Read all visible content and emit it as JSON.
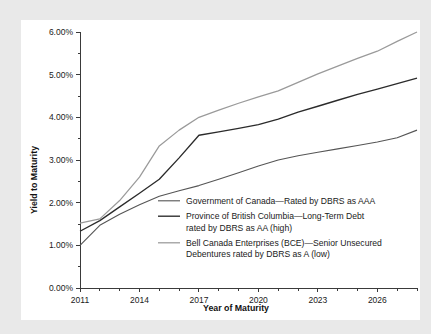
{
  "page": {
    "background_color": "#e9e9e9",
    "panel_color": "#ffffff"
  },
  "chart_data": {
    "type": "line",
    "title": "",
    "xlabel": "Year of Maturity",
    "ylabel": "Yield to Maturity",
    "xlim": [
      2011,
      2028
    ],
    "ylim": [
      0,
      6
    ],
    "grid": false,
    "legend_position": "inside-lower-right",
    "x_tick_labels": [
      "2011",
      "2014",
      "2017",
      "2020",
      "2023",
      "2026"
    ],
    "x_tick_values": [
      2011,
      2014,
      2017,
      2020,
      2023,
      2026
    ],
    "x_minor_tick_values": [
      2012,
      2013,
      2015,
      2016,
      2018,
      2019,
      2021,
      2022,
      2024,
      2025,
      2027,
      2028
    ],
    "y_tick_labels": [
      "0.00%",
      "1.00%",
      "2.00%",
      "3.00%",
      "4.00%",
      "5.00%",
      "6.00%"
    ],
    "y_tick_values": [
      0,
      1,
      2,
      3,
      4,
      5,
      6
    ],
    "y_minor_tick_values": [
      0.5,
      1.5,
      2.5,
      3.5,
      4.5,
      5.5
    ],
    "series": [
      {
        "name": "Government of Canada—Rated by DBRS as AAA",
        "legend_label": "Government of Canada—Rated by DBRS as AAA",
        "color": "#555555",
        "width": 1.1,
        "x": [
          2011,
          2012,
          2013,
          2014,
          2015,
          2016,
          2017,
          2018,
          2019,
          2020,
          2021,
          2022,
          2023,
          2024,
          2025,
          2026,
          2027,
          2028
        ],
        "values": [
          1.0,
          1.47,
          1.73,
          1.95,
          2.15,
          2.28,
          2.4,
          2.55,
          2.7,
          2.86,
          3.0,
          3.1,
          3.18,
          3.26,
          3.34,
          3.42,
          3.52,
          3.7
        ]
      },
      {
        "name": "Province of British Columbia—Long-Term Debt rated by DBRS as AA (high)",
        "legend_label_line1": "Province of British Columbia—Long-Term Debt",
        "legend_label_line2": "rated by DBRS as AA (high)",
        "color": "#2b2b2b",
        "width": 1.35,
        "x": [
          2011,
          2012,
          2013,
          2014,
          2015,
          2016,
          2017,
          2018,
          2019,
          2020,
          2021,
          2022,
          2023,
          2024,
          2025,
          2026,
          2027,
          2028
        ],
        "values": [
          1.33,
          1.58,
          1.9,
          2.22,
          2.55,
          3.05,
          3.58,
          3.66,
          3.74,
          3.83,
          3.96,
          4.12,
          4.26,
          4.4,
          4.54,
          4.66,
          4.79,
          4.92
        ]
      },
      {
        "name": "Bell Canada Enterprises (BCE)—Senior Unsecured Debentures rated by DBRS as A (low)",
        "legend_label_line1": "Bell Canada Enterprises (BCE)—Senior Unsecured",
        "legend_label_line2": "Debentures rated by DBRS as A (low)",
        "color": "#9a9a9a",
        "width": 1.25,
        "x": [
          2011,
          2012,
          2013,
          2014,
          2015,
          2016,
          2017,
          2018,
          2019,
          2020,
          2021,
          2022,
          2023,
          2024,
          2025,
          2026,
          2027,
          2028
        ],
        "values": [
          1.52,
          1.62,
          2.05,
          2.6,
          3.33,
          3.7,
          4.0,
          4.17,
          4.33,
          4.48,
          4.62,
          4.82,
          5.02,
          5.2,
          5.38,
          5.55,
          5.78,
          6.0
        ]
      }
    ]
  },
  "legend": {
    "entries": [
      {
        "swatch_color": "#555555",
        "swatch_width": 1.1,
        "lines": [
          "Government of Canada—Rated by DBRS as AAA"
        ]
      },
      {
        "swatch_color": "#2b2b2b",
        "swatch_width": 1.35,
        "lines": [
          "Province of British Columbia—Long-Term Debt",
          "rated by DBRS as AA (high)"
        ]
      },
      {
        "swatch_color": "#9a9a9a",
        "swatch_width": 1.25,
        "lines": [
          "Bell Canada Enterprises (BCE)—Senior Unsecured",
          "Debentures rated by DBRS as A (low)"
        ]
      }
    ]
  }
}
